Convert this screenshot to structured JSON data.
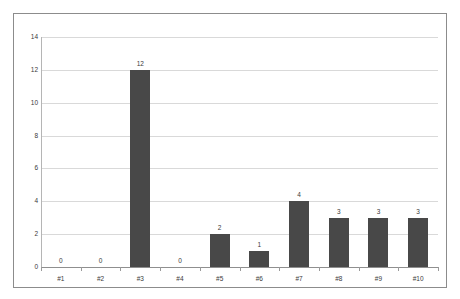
{
  "chart_data": {
    "type": "bar",
    "title": "",
    "subtitle": "",
    "xlabel": "",
    "ylabel": "",
    "categories": [
      "#1",
      "#2",
      "#3",
      "#4",
      "#5",
      "#6",
      "#7",
      "#8",
      "#9",
      "#10"
    ],
    "values": [
      0,
      0,
      12,
      0,
      2,
      1,
      4,
      3,
      3,
      3
    ],
    "data_labels": [
      "0",
      "0",
      "12",
      "0",
      "2",
      "1",
      "4",
      "3",
      "3",
      "3"
    ],
    "ylim": [
      0,
      14
    ],
    "y_ticks": [
      0,
      2,
      4,
      6,
      8,
      10,
      12,
      14
    ],
    "y_tick_labels": [
      "0",
      "2",
      "4",
      "6",
      "8",
      "10",
      "12",
      "14"
    ],
    "grid": true,
    "grid_axis": "y",
    "legend": false,
    "legend_position": "none",
    "bar_color": "#484848",
    "gridline_color": "#d9d9d9",
    "axis_color": "#8f8f8f",
    "frame_color": "#8c8c8c",
    "background_color": "#ffffff",
    "text_color": "#3a3a3a"
  }
}
